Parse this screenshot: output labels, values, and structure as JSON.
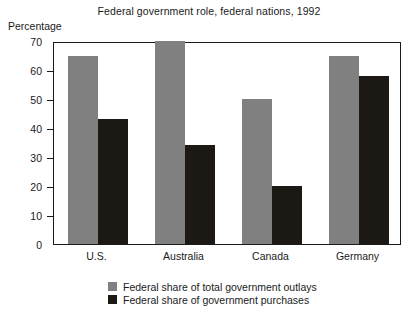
{
  "chart_data": {
    "type": "bar",
    "title": "Federal government role, federal nations, 1992",
    "xlabel": "",
    "ylabel": "Percentage",
    "ylim": [
      0,
      70
    ],
    "yticks": [
      0,
      10,
      20,
      30,
      40,
      50,
      60,
      70
    ],
    "ytick_labels": [
      "0",
      "10",
      "20",
      "30",
      "40",
      "50",
      "60",
      "70"
    ],
    "grid": false,
    "legend_position": "bottom-center",
    "categories": [
      "U.S.",
      "Australia",
      "Canada",
      "Germany"
    ],
    "series": [
      {
        "name": "Federal share of total government outlays",
        "color": "#808080",
        "values": [
          65,
          70,
          50,
          65
        ]
      },
      {
        "name": "Federal share of government purchases",
        "color": "#1c1814",
        "values": [
          43,
          34,
          20,
          58
        ]
      }
    ]
  },
  "colors": {
    "outlays": "#808080",
    "purchases": "#1c1814",
    "axis": "#1a1a1a",
    "background": "#ffffff"
  }
}
